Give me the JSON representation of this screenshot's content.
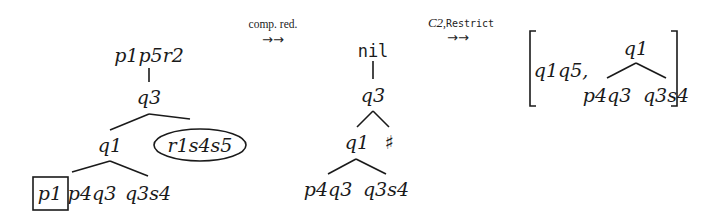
{
  "diagram": {
    "tree1": {
      "root": "p1p5r2",
      "child": "q3",
      "left": "q1",
      "right_ellipse": "r1s4s5",
      "leaf_boxed": "p1",
      "leaf2": "p4q3",
      "leaf3": "q3s4"
    },
    "step1": {
      "label": "comp. red.",
      "arrow": "→→"
    },
    "tree2": {
      "root": "nil",
      "child": "q3",
      "left": "q1",
      "right": "♯",
      "leaf1": "p4q3",
      "leaf2": "q3s4"
    },
    "step2": {
      "label_italic": "C2",
      "label_sep": ",",
      "label_mono": "Restrict",
      "arrow": "→→"
    },
    "result": {
      "first": "q1q5,",
      "root": "q1",
      "leaf1": "p4q3",
      "leaf2": "q3s4"
    }
  }
}
